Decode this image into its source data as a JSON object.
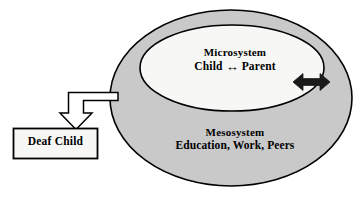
{
  "diagram": {
    "background_color": "#ffffff",
    "outline_color": "#000000",
    "meso_fill_color": "#c9c9c9",
    "micro_fill_color": "#f7f7f5",
    "box_fill_color": "#f7f7f5",
    "arrow_fill_color": "#ffffff",
    "bidirectional_arrow_color": "#1a1a1a"
  },
  "outer_system": {
    "name": "Mesosystem",
    "title": "Mesosystem",
    "subtitle": "Education, Work, Peers"
  },
  "inner_system": {
    "name": "Microsystem",
    "title": "Microsystem",
    "relation": {
      "left_node": "Child",
      "arrow_glyph": "↔",
      "right_node": "Parent"
    }
  },
  "external_box": {
    "label": "Deaf Child"
  },
  "connectors": {
    "elbow_arrow": {
      "name": "mesosystem-to-deaf-child-arrow",
      "style": "hollow-block-arrow",
      "direction": "down"
    },
    "boundary_arrow": {
      "name": "microsystem-mesosystem-exchange-arrow",
      "style": "solid-double-headed-arrow",
      "direction": "bidirectional"
    }
  }
}
